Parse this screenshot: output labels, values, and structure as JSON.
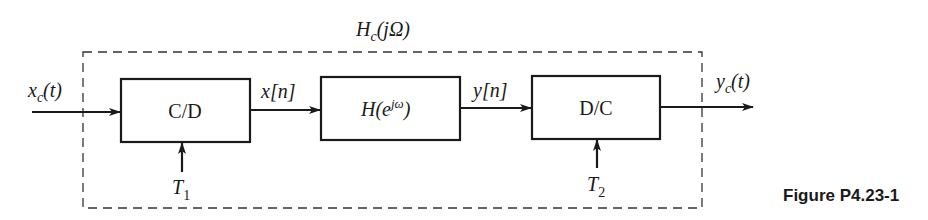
{
  "diagram": {
    "type": "block-diagram",
    "overall_system_label": "H_c(jΩ)",
    "input": {
      "label": "x_c(t)"
    },
    "output": {
      "label": "y_c(t)"
    },
    "blocks": [
      {
        "id": "cd",
        "label": "C/D",
        "control_input": {
          "label": "T_1"
        }
      },
      {
        "id": "h",
        "label": "H(e^{jω})"
      },
      {
        "id": "dc",
        "label": "D/C",
        "control_input": {
          "label": "T_2"
        }
      }
    ],
    "signals": [
      {
        "from": "input",
        "to": "cd",
        "label": "x_c(t)"
      },
      {
        "from": "cd",
        "to": "h",
        "label": "x[n]"
      },
      {
        "from": "h",
        "to": "dc",
        "label": "y[n]"
      },
      {
        "from": "dc",
        "to": "output",
        "label": "y_c(t)"
      }
    ]
  },
  "labels": {
    "hc_main": "H",
    "hc_sub": "c",
    "hc_arg": "(jΩ)",
    "xc_main": "x",
    "xc_sub": "c",
    "xc_arg": "(t)",
    "xn": "x[n]",
    "yn": "y[n]",
    "yc_main": "y",
    "yc_sub": "c",
    "yc_arg": "(t)",
    "cd_block": "C/D",
    "h_main": "H(e",
    "h_sup": "jω",
    "h_close": ")",
    "dc_block": "D/C",
    "t1_main": "T",
    "t1_sub": "1",
    "t2_main": "T",
    "t2_sub": "2"
  },
  "caption": "Figure P4.23-1",
  "colors": {
    "ink": "#1a1a1a",
    "dash": "#333333",
    "background": "#ffffff"
  }
}
